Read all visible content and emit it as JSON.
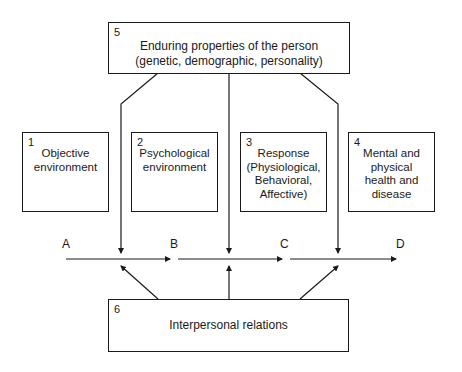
{
  "diagram": {
    "top_box": {
      "number": "5",
      "line1": "Enduring properties of the person",
      "line2": "(genetic, demographic, personality)"
    },
    "boxes": [
      {
        "number": "1",
        "lines": [
          "Objective",
          "environment"
        ]
      },
      {
        "number": "2",
        "lines": [
          "Psychological",
          "environment"
        ]
      },
      {
        "number": "3",
        "lines": [
          "Response",
          "(Physiological,",
          "Behavioral,",
          "Affective)"
        ]
      },
      {
        "number": "4",
        "lines": [
          "Mental and",
          "physical",
          "health and",
          "disease"
        ]
      }
    ],
    "bottom_box": {
      "number": "6",
      "label": "Interpersonal relations"
    },
    "path_labels": [
      "A",
      "B",
      "C",
      "D"
    ],
    "colors": {
      "line": "#1a1a1a",
      "background": "#ffffff"
    }
  }
}
